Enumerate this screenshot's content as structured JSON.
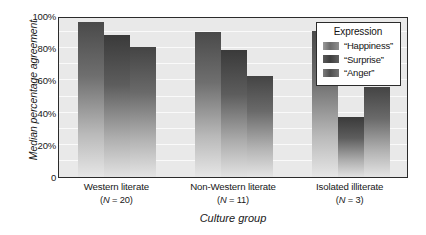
{
  "chart_data": {
    "type": "bar",
    "title": "",
    "xlabel": "Culture group",
    "ylabel": "Median percentage agreement",
    "ylim": [
      0,
      100
    ],
    "yticks": [
      0,
      20,
      40,
      60,
      80,
      100
    ],
    "ytick_labels": [
      "0",
      "20%",
      "40%",
      "60%",
      "80%",
      "100%"
    ],
    "grid": true,
    "grid_step": 10,
    "legend_title": "Expression",
    "legend_position": "top-right inside",
    "categories": [
      "Western literate",
      "Non-Western literate",
      "Isolated illiterate"
    ],
    "category_sublabels": [
      "(N = 20)",
      "(N = 11)",
      "(N = 3)"
    ],
    "category_n": [
      20,
      11,
      3
    ],
    "series": [
      {
        "name": "“Happiness”",
        "values": [
          96,
          90,
          91
        ]
      },
      {
        "name": "“Surprise”",
        "values": [
          88,
          79,
          37
        ]
      },
      {
        "name": "“Anger”",
        "values": [
          81,
          63,
          56
        ]
      }
    ],
    "colors": {
      "plot_background": "#e9e9e9",
      "gridline": "#fafafa",
      "axis": "#2b2b2b",
      "text": "#181818",
      "series_fill_top": "#4a4a4a",
      "series_fill_bottom": "#e6e6e6"
    }
  },
  "axes": {
    "y_title": "Median percentage agreement",
    "x_title": "Culture group",
    "y_ticks": [
      "100%",
      "80%",
      "60%",
      "40%",
      "20%",
      "0"
    ]
  },
  "legend": {
    "title": "Expression",
    "entries": [
      {
        "label": "“Happiness”",
        "swatch": "swatch-happiness"
      },
      {
        "label": "“Surprise”",
        "swatch": "swatch-surprise"
      },
      {
        "label": "“Anger”",
        "swatch": "swatch-anger"
      }
    ]
  },
  "x_categories": [
    {
      "name": "Western literate",
      "n_prefix": "(",
      "n_italic": "N",
      "n_suffix": " = 20)"
    },
    {
      "name": "Non-Western literate",
      "n_prefix": "(",
      "n_italic": "N",
      "n_suffix": " = 11)"
    },
    {
      "name": "Isolated illiterate",
      "n_prefix": "(",
      "n_italic": "N",
      "n_suffix": " = 3)"
    }
  ]
}
